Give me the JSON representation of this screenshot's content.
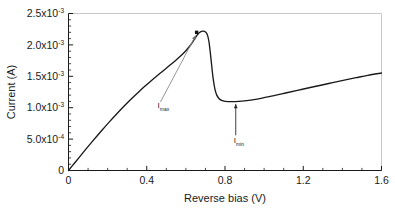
{
  "chart_data": {
    "type": "line",
    "title": "",
    "xlabel": "Reverse bias (V)",
    "ylabel": "Current (A)",
    "xlim": [
      0,
      1.6
    ],
    "ylim": [
      0,
      0.0025
    ],
    "grid": false,
    "legend": null,
    "x_ticks": [
      {
        "value": 0,
        "label": "0"
      },
      {
        "value": 0.4,
        "label": "0.4"
      },
      {
        "value": 0.8,
        "label": "0.8"
      },
      {
        "value": 1.2,
        "label": "1.2"
      },
      {
        "value": 1.6,
        "label": "1.6"
      }
    ],
    "x_minor_step": 0.1,
    "y_ticks": [
      {
        "value": 0,
        "mantissa": "0",
        "times": "",
        "base": "",
        "exponent": ""
      },
      {
        "value": 0.0005,
        "mantissa": "5.0",
        "times": "x",
        "base": "10",
        "exponent": "-4"
      },
      {
        "value": 0.001,
        "mantissa": "1.0",
        "times": "x",
        "base": "10",
        "exponent": "-3"
      },
      {
        "value": 0.0015,
        "mantissa": "1.5",
        "times": "x",
        "base": "10",
        "exponent": "-3"
      },
      {
        "value": 0.002,
        "mantissa": "2.0",
        "times": "x",
        "base": "10",
        "exponent": "-3"
      },
      {
        "value": 0.0025,
        "mantissa": "2.5",
        "times": "x",
        "base": "10",
        "exponent": "-3"
      }
    ],
    "y_minor_step": 0.0001,
    "series": [
      {
        "name": "I-V characteristic",
        "color": "#1a1a1a",
        "x": [
          0.0,
          0.03,
          0.06,
          0.09,
          0.12,
          0.15,
          0.18,
          0.21,
          0.24,
          0.27,
          0.3,
          0.33,
          0.36,
          0.39,
          0.42,
          0.45,
          0.48,
          0.51,
          0.54,
          0.57,
          0.6,
          0.62,
          0.64,
          0.655,
          0.67,
          0.685,
          0.695,
          0.705,
          0.712,
          0.718,
          0.723,
          0.728,
          0.733,
          0.738,
          0.744,
          0.75,
          0.758,
          0.768,
          0.78,
          0.795,
          0.815,
          0.84,
          0.87,
          0.9,
          0.94,
          0.99,
          1.05,
          1.11,
          1.17,
          1.23,
          1.29,
          1.35,
          1.41,
          1.47,
          1.53,
          1.6
        ],
        "y": [
          0.0,
          0.000115,
          0.00023,
          0.000344,
          0.000456,
          0.000566,
          0.000673,
          0.000778,
          0.00088,
          0.000979,
          0.001074,
          0.001166,
          0.001255,
          0.00134,
          0.001422,
          0.001501,
          0.001578,
          0.001655,
          0.001733,
          0.001815,
          0.001908,
          0.001982,
          0.002072,
          0.002145,
          0.002196,
          0.002218,
          0.002215,
          0.00219,
          0.00214,
          0.00205,
          0.00193,
          0.00179,
          0.00164,
          0.0015,
          0.001372,
          0.001275,
          0.0012,
          0.00115,
          0.00112,
          0.001105,
          0.001098,
          0.001096,
          0.0011,
          0.001108,
          0.001124,
          0.001152,
          0.001192,
          0.001234,
          0.001276,
          0.001318,
          0.001358,
          0.001399,
          0.00144,
          0.001478,
          0.001515,
          0.001552
        ]
      }
    ],
    "markers": [
      {
        "name": "peak-marker",
        "x": 0.655,
        "y": 0.0022,
        "shape": "square",
        "color": "#111111"
      }
    ],
    "annotations": [
      {
        "name": "i-max",
        "symbol": "I",
        "subscript": "max",
        "label_x": 0.455,
        "label_y": 0.00099,
        "arrow_from_x": 0.47,
        "arrow_from_y": 0.00109,
        "arrow_to_x": 0.65,
        "arrow_to_y": 0.00215,
        "arrow_style": "diagonal"
      },
      {
        "name": "i-min",
        "symbol": "I",
        "subscript": "min",
        "label_x": 0.845,
        "label_y": 0.00043,
        "arrow_from_x": 0.855,
        "arrow_from_y": 0.00056,
        "arrow_to_x": 0.855,
        "arrow_to_y": 0.00106,
        "arrow_style": "vertical"
      }
    ],
    "peak_value": 0.00222,
    "peak_position": 0.655,
    "valley_value": 0.0011,
    "valley_position": 0.855
  },
  "figure": {
    "background": "#ffffff",
    "axis_color": "#1a1a1a",
    "frame_color": "#c8c8c8"
  }
}
